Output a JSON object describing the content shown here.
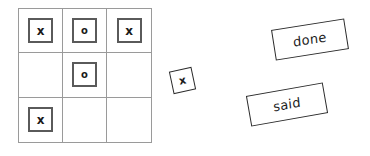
{
  "canvas": {
    "background_color": "#ffffff",
    "width": 370,
    "height": 156
  },
  "board": {
    "name": "tic-tac-toe-grid",
    "rows": 3,
    "columns": 3,
    "grid_line_color": "#9a9a9a",
    "tile_border_color": "#5a5a5a",
    "cells": [
      {
        "row": 1,
        "col": 1,
        "mark": "x",
        "filled": true
      },
      {
        "row": 1,
        "col": 2,
        "mark": "o",
        "filled": true
      },
      {
        "row": 1,
        "col": 3,
        "mark": "x",
        "filled": true
      },
      {
        "row": 2,
        "col": 1,
        "mark": "",
        "filled": false
      },
      {
        "row": 2,
        "col": 2,
        "mark": "o",
        "filled": true
      },
      {
        "row": 2,
        "col": 3,
        "mark": "",
        "filled": false
      },
      {
        "row": 3,
        "col": 1,
        "mark": "x",
        "filled": true
      },
      {
        "row": 3,
        "col": 2,
        "mark": "",
        "filled": false
      },
      {
        "row": 3,
        "col": 3,
        "mark": "",
        "filled": false
      }
    ]
  },
  "loose_tile": {
    "name": "loose-x-tile",
    "mark": "x",
    "border_color": "#2b2b2b"
  },
  "word_cards": [
    {
      "id": "done",
      "text": "done",
      "border_color": "#2b2b2b"
    },
    {
      "id": "said",
      "text": "said",
      "border_color": "#2b2b2b"
    }
  ]
}
